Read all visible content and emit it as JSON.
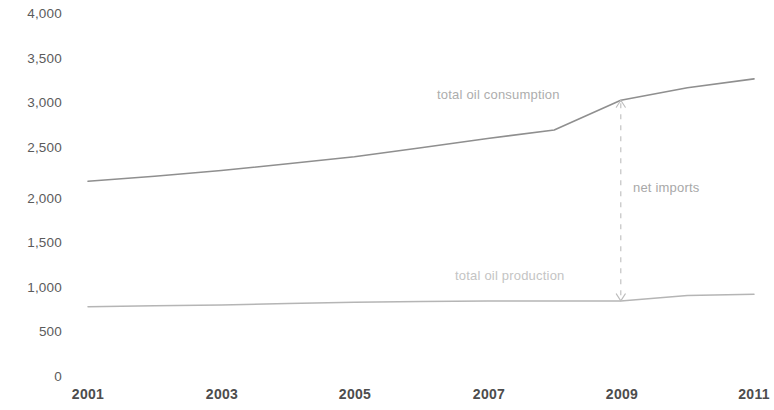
{
  "chart_data": {
    "type": "line",
    "title": "",
    "subtitle": "",
    "xlabel": "",
    "ylabel": "",
    "xlim": [
      2001,
      2011
    ],
    "ylim": [
      0,
      4000
    ],
    "grid": false,
    "legend_position": "inline-labels",
    "x_tick_labels": [
      "2001",
      "2003",
      "2005",
      "2007",
      "2009",
      "2011"
    ],
    "x_tick_values": [
      2001,
      2003,
      2005,
      2007,
      2009,
      2011
    ],
    "y_tick_labels": [
      "0",
      "500",
      "1,000",
      "1,500",
      "2,000",
      "2,500",
      "3,000",
      "3,500",
      "4,000"
    ],
    "y_tick_values": [
      0,
      500,
      1000,
      1500,
      2000,
      2500,
      3000,
      3500,
      4000
    ],
    "x": [
      2001,
      2002,
      2003,
      2004,
      2005,
      2006,
      2007,
      2008,
      2009,
      2010,
      2011
    ],
    "series": [
      {
        "name": "total oil consumption",
        "color": "#8f8f8f",
        "values": [
          2200,
          2255,
          2320,
          2395,
          2475,
          2575,
          2680,
          2775,
          3110,
          3250,
          3350
        ]
      },
      {
        "name": "total oil production",
        "color": "#b5b5b5",
        "values": [
          790,
          800,
          810,
          825,
          840,
          850,
          855,
          855,
          855,
          915,
          930
        ]
      }
    ],
    "annotations": [
      {
        "name": "net imports",
        "label": "net imports",
        "type": "double-arrow",
        "x": 2009,
        "y_from": 855,
        "y_to": 3110,
        "color": "#bdbdbd"
      }
    ],
    "series_labels": [
      {
        "text": "total oil consumption",
        "color": "#adadad"
      },
      {
        "text": "total oil production",
        "color": "#c2c2c2"
      }
    ]
  },
  "axis": {
    "y_ticks": [
      {
        "label": "4,000",
        "y": 14
      },
      {
        "label": "3,500",
        "y": 59
      },
      {
        "label": "3,000",
        "y": 103
      },
      {
        "label": "2,500",
        "y": 148
      },
      {
        "label": "2,000",
        "y": 199
      },
      {
        "label": "1,500",
        "y": 243
      },
      {
        "label": "1,000",
        "y": 288
      },
      {
        "label": "500",
        "y": 332
      },
      {
        "label": "0",
        "y": 377
      }
    ],
    "x_ticks": [
      {
        "label": "2001",
        "x": 88
      },
      {
        "label": "2003",
        "x": 222
      },
      {
        "label": "2005",
        "x": 355
      },
      {
        "label": "2007",
        "x": 489
      },
      {
        "label": "2009",
        "x": 622
      },
      {
        "label": "2011",
        "x": 754
      }
    ]
  },
  "labels": {
    "consumption": "total oil consumption",
    "production": "total oil production",
    "net_imports": "net imports"
  }
}
